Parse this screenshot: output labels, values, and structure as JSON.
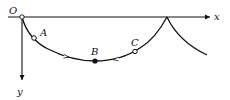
{
  "diagram": {
    "type": "cycloid-path",
    "colors": {
      "stroke": "#111111",
      "background": "#ffffff"
    },
    "axes": {
      "origin_label": "O",
      "x_label": "x",
      "y_label": "y"
    },
    "points": [
      {
        "label": "A",
        "marker": "open-circle"
      },
      {
        "label": "B",
        "marker": "filled-circle"
      },
      {
        "label": "C",
        "marker": "open-circle"
      }
    ],
    "direction_arrows": 2,
    "cusp": "second arch begins at x-axis"
  }
}
